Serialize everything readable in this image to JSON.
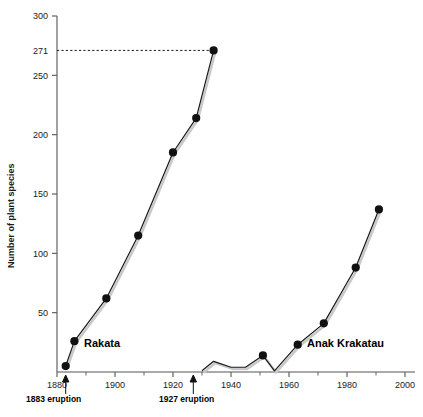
{
  "chart_data": {
    "type": "line",
    "title": "",
    "xlabel": "",
    "ylabel": "Number of plant species",
    "xlim": [
      1880,
      2000
    ],
    "ylim": [
      0,
      300
    ],
    "grid": false,
    "legend": "inline-series-labels",
    "x_ticks": [
      1880,
      1900,
      1920,
      1940,
      1960,
      1980,
      2000
    ],
    "x_minor_ticks": [
      1890,
      1910,
      1930,
      1950,
      1970,
      1990
    ],
    "y_ticks": [
      50,
      100,
      150,
      200,
      250,
      271,
      300
    ],
    "y_tick_labels": [
      "50",
      "100",
      "150",
      "200",
      "250",
      "271",
      "300"
    ],
    "series": [
      {
        "name": "Rakata",
        "x": [
          1883,
          1886,
          1897,
          1908,
          1920,
          1928,
          1934
        ],
        "values": [
          5,
          26,
          62,
          115,
          185,
          214,
          271
        ]
      },
      {
        "name": "Anak Krakatau",
        "x": [
          1930,
          1934,
          1940,
          1945,
          1951,
          1955,
          1963,
          1972,
          1983,
          1991
        ],
        "values": [
          1,
          9,
          4,
          4,
          14,
          1,
          23,
          41,
          88,
          137
        ]
      }
    ],
    "marker_series_points": {
      "Rakata": [
        1883,
        1886,
        1897,
        1908,
        1920,
        1928,
        1934
      ],
      "Anak Krakatau": [
        1951,
        1963,
        1972,
        1983,
        1991
      ]
    },
    "annotations": [
      {
        "name": "guide-271",
        "type": "dashed-horizontal",
        "value": 271,
        "from_x": 1880,
        "to_x": 1934
      },
      {
        "name": "eruption-1883",
        "type": "arrow-up",
        "x": 1883,
        "label": "1883 eruption"
      },
      {
        "name": "eruption-1927",
        "type": "arrow-up",
        "x": 1927,
        "label": "1927 eruption"
      }
    ]
  },
  "labels": {
    "y_axis_title": "Number of plant species",
    "series_rakata": "Rakata",
    "series_anak": "Anak Krakatau",
    "annotation_1883": "1883 eruption",
    "annotation_1927": "1927 eruption",
    "y_300": "300",
    "y_271": "271",
    "y_250": "250",
    "y_200": "200",
    "y_150": "150",
    "y_100": "100",
    "y_50": "50",
    "x_1880": "1880",
    "x_1900": "1900",
    "x_1920": "1920",
    "x_1940": "1940",
    "x_1960": "1960",
    "x_1980": "1980",
    "x_2000": "2000"
  },
  "colors": {
    "line": "#1a1a1a",
    "shadow": "#c9c9c9",
    "axis": "#555555",
    "marker": "#111111",
    "background": "#ffffff"
  }
}
